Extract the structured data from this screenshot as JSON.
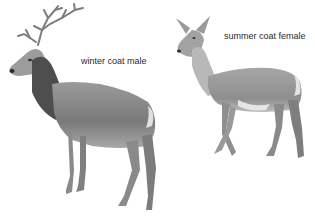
{
  "figure": {
    "labels": {
      "male": "winter coat male",
      "female": "summer coat female"
    },
    "subjects": [
      {
        "name": "male deer",
        "coat": "winter coat",
        "position": "left"
      },
      {
        "name": "female deer",
        "coat": "summer coat",
        "position": "right"
      }
    ],
    "colors": {
      "background": "#ffffff",
      "body_mid": "#8c8c8c",
      "body_dark": "#4a4a4a",
      "body_light": "#d4d4d4",
      "text": "#2a2a2a"
    }
  }
}
